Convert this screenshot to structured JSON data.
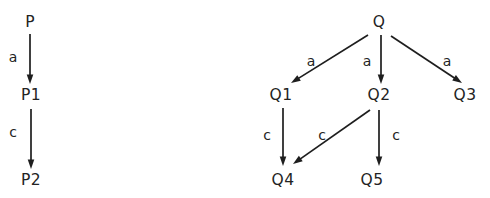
{
  "figure": {
    "background_color": "#ffffff",
    "ink_color": "#232323",
    "width": 490,
    "height": 198,
    "diagrams": [
      {
        "id": "left-process-p",
        "name": "process-p-diagram",
        "root_label": "P",
        "nodes": [
          {
            "id": "P",
            "label": "P",
            "x": 30,
            "y": 22
          },
          {
            "id": "P1",
            "label": "P1",
            "x": 31,
            "y": 95
          },
          {
            "id": "P2",
            "label": "P2",
            "x": 31,
            "y": 180
          }
        ],
        "edges": [
          {
            "id": "P-to-P1",
            "from": "P",
            "to": "P1",
            "label": "a",
            "label_x": 13,
            "label_y": 58,
            "x1": 30,
            "y1": 34,
            "x2": 30,
            "y2": 84
          },
          {
            "id": "P1-to-P2",
            "from": "P1",
            "to": "P2",
            "label": "c",
            "label_x": 13,
            "label_y": 133,
            "x1": 31,
            "y1": 109,
            "x2": 31,
            "y2": 169
          }
        ]
      },
      {
        "id": "right-process-q",
        "name": "process-q-diagram",
        "root_label": "Q",
        "nodes": [
          {
            "id": "Q",
            "label": "Q",
            "x": 379,
            "y": 22
          },
          {
            "id": "Q1",
            "label": "Q1",
            "x": 281,
            "y": 95
          },
          {
            "id": "Q2",
            "label": "Q2",
            "x": 379,
            "y": 95
          },
          {
            "id": "Q3",
            "label": "Q3",
            "x": 465,
            "y": 95
          },
          {
            "id": "Q4",
            "label": "Q4",
            "x": 283,
            "y": 180
          },
          {
            "id": "Q5",
            "label": "Q5",
            "x": 372,
            "y": 180
          }
        ],
        "edges": [
          {
            "id": "Q-to-Q1",
            "from": "Q",
            "to": "Q1",
            "label": "a",
            "label_x": 311,
            "label_y": 62,
            "x1": 368,
            "y1": 35,
            "x2": 291,
            "y2": 83
          },
          {
            "id": "Q-to-Q2",
            "from": "Q",
            "to": "Q2",
            "label": "a",
            "label_x": 367,
            "label_y": 62,
            "x1": 381,
            "y1": 35,
            "x2": 381,
            "y2": 84
          },
          {
            "id": "Q-to-Q3",
            "from": "Q",
            "to": "Q3",
            "label": "a",
            "label_x": 447,
            "label_y": 62,
            "x1": 391,
            "y1": 36,
            "x2": 462,
            "y2": 83
          },
          {
            "id": "Q1-to-Q4",
            "from": "Q1",
            "to": "Q4",
            "label": "c",
            "label_x": 267,
            "label_y": 136,
            "x1": 283,
            "y1": 108,
            "x2": 283,
            "y2": 166
          },
          {
            "id": "Q2-to-Q4",
            "from": "Q2",
            "to": "Q4",
            "label": "c",
            "label_x": 322,
            "label_y": 136,
            "x1": 370,
            "y1": 110,
            "x2": 293,
            "y2": 164
          },
          {
            "id": "Q2-to-Q5",
            "from": "Q2",
            "to": "Q5",
            "label": "c",
            "label_x": 396,
            "label_y": 136,
            "x1": 379,
            "y1": 110,
            "x2": 379,
            "y2": 166
          }
        ]
      }
    ]
  }
}
